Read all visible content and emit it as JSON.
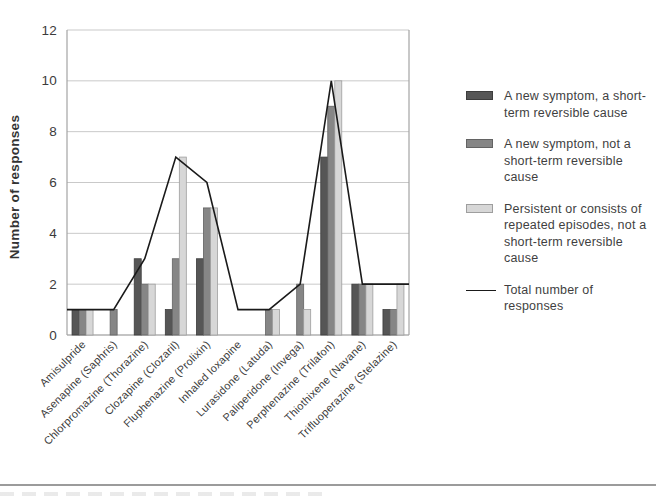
{
  "chart_data": {
    "type": "bar",
    "title": "",
    "xlabel": "",
    "ylabel": "Number of responses",
    "ylim": [
      0,
      12
    ],
    "yticks": [
      0,
      2,
      4,
      6,
      8,
      10,
      12
    ],
    "grid": "horizontal",
    "legend_position": "right",
    "categories": [
      "Amisulpride",
      "Asenapine (Saphris)",
      "Chlorpromazine (Thorazine)",
      "Clozapine (Clozaril)",
      "Fluphenazine (Prolixin)",
      "Inhaled loxapine",
      "Lurasidone (Latuda)",
      "Paliperidone (Invega)",
      "Perphenazine (Trilafon)",
      "Thiothixene (Navane)",
      "Trifluoperazine (Stelazine)"
    ],
    "series": [
      {
        "name": "A new symptom, a short-term reversible cause",
        "kind": "bar",
        "color": "#565656",
        "border": "#3d3d3d",
        "values": [
          1,
          0,
          3,
          1,
          3,
          0,
          0,
          0,
          7,
          2,
          1
        ]
      },
      {
        "name": "A new symptom, not a short-term reversible cause",
        "kind": "bar",
        "color": "#868686",
        "border": "#636363",
        "values": [
          1,
          1,
          2,
          3,
          5,
          0,
          1,
          2,
          9,
          2,
          1
        ]
      },
      {
        "name": "Persistent or consists of repeated episodes, not a short-term reversible cause",
        "kind": "bar",
        "color": "#d7d7d7",
        "border": "#9e9e9e",
        "values": [
          1,
          0,
          2,
          7,
          5,
          0,
          1,
          1,
          10,
          2,
          2
        ]
      },
      {
        "name": "Total number of responses",
        "kind": "line",
        "color": "#1a1a1a",
        "values": [
          1,
          1,
          3,
          7,
          6,
          1,
          1,
          2,
          10,
          2,
          2
        ],
        "extends_to_plot_edges": true,
        "edge_values": [
          1,
          2
        ]
      }
    ],
    "colors": {
      "gridline": "#c9c9c9",
      "plot_border": "#a3a3a3",
      "tick_text": "#3b3b3b"
    }
  },
  "legend": {
    "items": [
      {
        "label": "A new symptom, a short-term reversible cause",
        "swatch": "bar",
        "color": "#565656",
        "border": "#3d3d3d"
      },
      {
        "label": "A new symptom, not a short-term reversible cause",
        "swatch": "bar",
        "color": "#868686",
        "border": "#636363"
      },
      {
        "label": "Persistent or consists of repeated episodes, not a short-term reversible cause",
        "swatch": "bar",
        "color": "#d7d7d7",
        "border": "#9e9e9e"
      },
      {
        "label": "Total number of responses",
        "swatch": "line",
        "color": "#1a1a1a"
      }
    ]
  },
  "page": {
    "bottom_rule": true
  }
}
